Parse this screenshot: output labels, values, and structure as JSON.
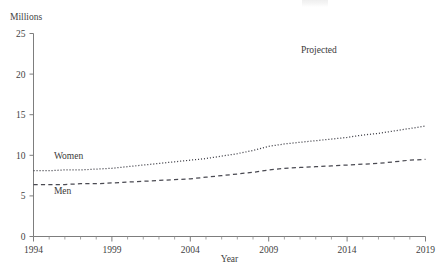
{
  "chart_data": {
    "type": "line",
    "title": "",
    "xlabel": "Year",
    "ylabel": "Millions",
    "x": [
      1994,
      1995,
      1996,
      1997,
      1998,
      1999,
      2000,
      2001,
      2002,
      2003,
      2004,
      2005,
      2006,
      2007,
      2008,
      2009,
      2010,
      2011,
      2012,
      2013,
      2014,
      2015,
      2016,
      2017,
      2018,
      2019
    ],
    "xlim": [
      1994,
      2019
    ],
    "ylim": [
      0,
      25
    ],
    "yticks": [
      0,
      5,
      10,
      15,
      20,
      25
    ],
    "xticks": [
      1994,
      1999,
      2004,
      2009,
      2014,
      2019
    ],
    "xtick_labels": [
      "1994",
      "1999",
      "2004",
      "2009",
      "2014",
      "2019"
    ],
    "ytick_labels": [
      "0",
      "5",
      "10",
      "15",
      "20",
      "25"
    ],
    "grid": false,
    "legend": "inline-labels",
    "series": [
      {
        "name": "Women",
        "style": "dotted",
        "values": [
          8.1,
          8.1,
          8.2,
          8.2,
          8.3,
          8.4,
          8.6,
          8.8,
          9.0,
          9.2,
          9.4,
          9.6,
          9.9,
          10.2,
          10.6,
          11.1,
          11.4,
          11.6,
          11.8,
          12.0,
          12.2,
          12.5,
          12.7,
          13.0,
          13.3,
          13.6
        ]
      },
      {
        "name": "Men",
        "style": "dashed",
        "values": [
          6.4,
          6.4,
          6.4,
          6.5,
          6.5,
          6.6,
          6.7,
          6.8,
          6.9,
          7.0,
          7.1,
          7.3,
          7.5,
          7.7,
          7.9,
          8.2,
          8.4,
          8.5,
          8.6,
          8.7,
          8.8,
          8.9,
          9.0,
          9.2,
          9.4,
          9.5
        ]
      }
    ],
    "annotations": [
      {
        "text": "Projected",
        "x": 2012.2,
        "y": 22.6
      }
    ],
    "series_inline_labels": [
      {
        "text": "Women",
        "x": 1995.3,
        "y": 9.6
      },
      {
        "text": "Men",
        "x": 1995.3,
        "y": 5.2
      }
    ],
    "colors": {
      "axis": "#7d7d7d",
      "text": "#3a3a3a",
      "women_line": "#43434b",
      "men_line": "#4a4a52",
      "background": "#ffffff"
    }
  }
}
